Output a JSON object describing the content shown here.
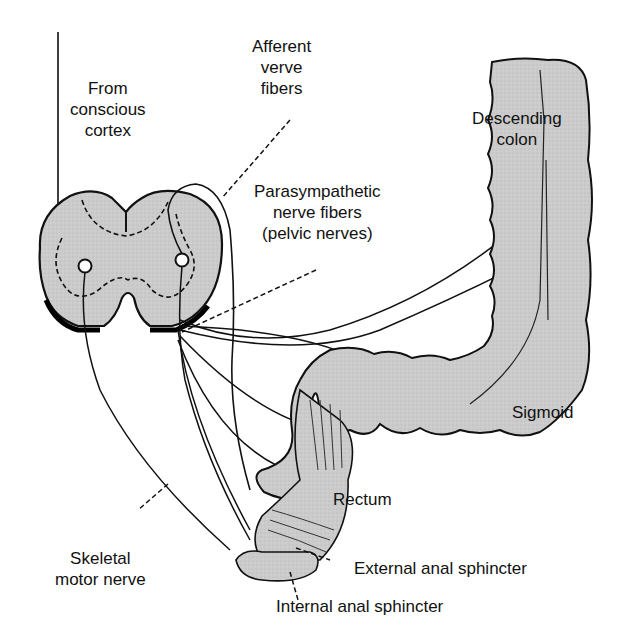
{
  "diagram": {
    "colors": {
      "tissue_fill": "#c9c9c9",
      "line": "#111111",
      "background": "#ffffff",
      "shadow": "#000000"
    },
    "labels": {
      "from_cortex": [
        "From",
        "conscious",
        "cortex"
      ],
      "afferent": [
        "Afferent",
        "verve",
        "fibers"
      ],
      "parasympathetic": [
        "Parasympathetic",
        "nerve fibers",
        "(pelvic nerves)"
      ],
      "descending_colon": [
        "Descending",
        "colon"
      ],
      "sigmoid": "Sigmoid",
      "rectum": "Rectum",
      "skeletal_motor": [
        "Skeletal",
        "motor nerve"
      ],
      "external_sphincter": "External anal sphincter",
      "internal_sphincter": "Internal anal sphincter"
    },
    "structures": [
      "spinal-cord-cross-section",
      "descending-colon",
      "sigmoid-colon",
      "rectum",
      "external-anal-sphincter",
      "internal-anal-sphincter"
    ]
  }
}
